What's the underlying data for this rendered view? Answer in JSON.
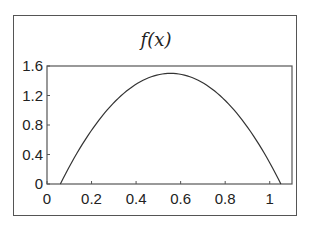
{
  "chart_data": {
    "type": "line",
    "title": "f(x)",
    "xlabel": "",
    "ylabel": "",
    "xlim": [
      0,
      1.1
    ],
    "ylim": [
      0,
      1.6
    ],
    "xticks": [
      0,
      0.2,
      0.4,
      0.6,
      0.8,
      1
    ],
    "xtick_labels": [
      "0",
      "0.2",
      "0.4",
      "0.6",
      "0.8",
      "1"
    ],
    "yticks": [
      0,
      0.4,
      0.8,
      1.2,
      1.6
    ],
    "ytick_labels": [
      "0",
      "0.4",
      "0.8",
      "1.2",
      "1.6"
    ],
    "grid": false,
    "legend": null,
    "series": [
      {
        "name": "f(x)",
        "x": [
          0.06,
          0.1,
          0.15,
          0.2,
          0.25,
          0.3,
          0.35,
          0.4,
          0.45,
          0.5,
          0.55,
          0.6,
          0.65,
          0.7,
          0.75,
          0.8,
          0.85,
          0.9,
          0.95,
          1.0,
          1.05
        ],
        "y": [
          0.0,
          0.23,
          0.5,
          0.73,
          0.93,
          1.1,
          1.24,
          1.35,
          1.43,
          1.48,
          1.5,
          1.49,
          1.45,
          1.38,
          1.28,
          1.15,
          0.99,
          0.8,
          0.57,
          0.32,
          0.0
        ]
      }
    ]
  }
}
